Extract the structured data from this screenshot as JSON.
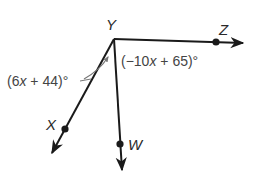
{
  "diagram": {
    "type": "angle-figure",
    "vertex": {
      "label": "Y",
      "x": 114,
      "y": 39
    },
    "rays": [
      {
        "name": "YZ",
        "point_label": "Z",
        "point": {
          "x": 216,
          "y": 42
        },
        "tip": {
          "x": 243,
          "y": 43
        }
      },
      {
        "name": "YX",
        "point_label": "X",
        "point": {
          "x": 65,
          "y": 129
        },
        "tip": {
          "x": 52,
          "y": 153
        }
      },
      {
        "name": "YW",
        "point_label": "W",
        "point": {
          "x": 120,
          "y": 144
        },
        "tip": {
          "x": 122,
          "y": 170
        }
      }
    ],
    "angles": [
      {
        "between": "XYW",
        "expr_prefix": "(6",
        "var": "x",
        "expr_suffix": " + 44)°"
      },
      {
        "between": "WYZ",
        "expr_prefix": "(−10",
        "var": "x",
        "expr_suffix": " + 65)°"
      }
    ],
    "colors": {
      "stroke": "#1a1a1a",
      "label": "#2a2a2a",
      "angle_label": "#444444",
      "arc": "#777777"
    }
  }
}
